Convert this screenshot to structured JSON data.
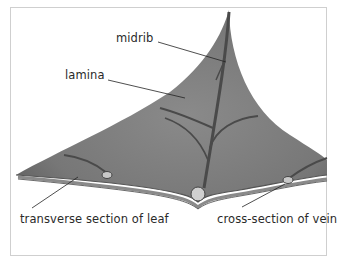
{
  "diagram": {
    "labels": {
      "midrib": "midrib",
      "lamina": "lamina",
      "transverse_section": "transverse section of leaf",
      "vein_cross_section": "cross-section of vein"
    },
    "colors": {
      "leaf": "#7f7f7f",
      "leaf_dark": "#5a5a5a",
      "vein": "#4a4a4a",
      "frame": "#cfcfcf"
    }
  }
}
